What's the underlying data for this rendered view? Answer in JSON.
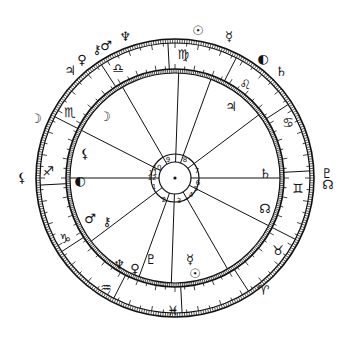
{
  "chart": {
    "center": [
      175,
      178
    ],
    "radii": {
      "outer_band_out": 139,
      "outer_band_in": 135,
      "inner_band_out": 109,
      "inner_band_in": 105,
      "hub_out": 24,
      "hub_in": 16
    },
    "ascendant_deg": 180,
    "colors": {
      "ink": "#111111",
      "paper": "#ffffff"
    }
  },
  "chart_data": {
    "type": "table",
    "zodiac_signs": [
      {
        "name": "Aries",
        "glyph": "♈",
        "pos": [
          263,
          290
        ]
      },
      {
        "name": "Taurus",
        "glyph": "♉",
        "pos": [
          278,
          250
        ]
      },
      {
        "name": "Gemini",
        "glyph": "♊",
        "pos": [
          298,
          188
        ]
      },
      {
        "name": "Cancer",
        "glyph": "♋",
        "pos": [
          288,
          122
        ]
      },
      {
        "name": "Leo",
        "glyph": "♌",
        "pos": [
          245,
          84
        ]
      },
      {
        "name": "Virgo",
        "glyph": "♍",
        "pos": [
          183,
          54
        ]
      },
      {
        "name": "Libra",
        "glyph": "♎",
        "pos": [
          118,
          68
        ]
      },
      {
        "name": "Scorpio",
        "glyph": "♏",
        "pos": [
          70,
          112
        ]
      },
      {
        "name": "Sagittarius",
        "glyph": "♐",
        "pos": [
          48,
          171
        ]
      },
      {
        "name": "Capricorn",
        "glyph": "♑",
        "pos": [
          65,
          238
        ]
      },
      {
        "name": "Aquarius",
        "glyph": "♒",
        "pos": [
          106,
          287
        ]
      },
      {
        "name": "Pisces",
        "glyph": "♓",
        "pos": [
          173,
          310
        ]
      }
    ],
    "house_cusp_angles": [
      180,
      217,
      250,
      268,
      300,
      333,
      0,
      37,
      70,
      88,
      120,
      153
    ],
    "house_numbers": [
      {
        "n": "1",
        "pos": [
          154,
          187
        ]
      },
      {
        "n": "2",
        "pos": [
          164,
          200
        ]
      },
      {
        "n": "3",
        "pos": [
          179,
          201
        ]
      },
      {
        "n": "4",
        "pos": [
          191,
          195
        ]
      },
      {
        "n": "5",
        "pos": [
          196,
          189
        ]
      },
      {
        "n": "6",
        "pos": [
          198,
          183
        ]
      },
      {
        "n": "7",
        "pos": [
          197,
          171
        ]
      },
      {
        "n": "8",
        "pos": [
          185,
          160
        ]
      },
      {
        "n": "9",
        "pos": [
          168,
          160
        ]
      },
      {
        "n": "10",
        "pos": [
          157,
          168
        ]
      },
      {
        "n": "11",
        "pos": [
          153,
          173
        ]
      },
      {
        "n": "12",
        "pos": [
          152,
          178
        ]
      }
    ],
    "inner_planets": [
      {
        "name": "Moon",
        "glyph": "☽",
        "pos": [
          105,
          116
        ]
      },
      {
        "name": "Jupiter",
        "glyph": "♃",
        "pos": [
          231,
          106
        ]
      },
      {
        "name": "Lilith",
        "glyph": "⚸",
        "pos": [
          85,
          153
        ]
      },
      {
        "name": "Sun (ASC)",
        "glyph": "◐",
        "pos": [
          80,
          180
        ]
      },
      {
        "name": "Mars",
        "glyph": "♂",
        "pos": [
          90,
          218
        ]
      },
      {
        "name": "Chiron",
        "glyph": "⚷",
        "pos": [
          107,
          221
        ]
      },
      {
        "name": "Neptune",
        "glyph": "♆",
        "pos": [
          119,
          264
        ]
      },
      {
        "name": "Venus",
        "glyph": "♀",
        "pos": [
          135,
          268
        ]
      },
      {
        "name": "Pluto",
        "glyph": "♇",
        "pos": [
          151,
          259
        ]
      },
      {
        "name": "Mercury",
        "glyph": "☿",
        "pos": [
          190,
          259
        ]
      },
      {
        "name": "Sun",
        "glyph": "☉",
        "pos": [
          195,
          273
        ]
      },
      {
        "name": "Saturn",
        "glyph": "♄",
        "pos": [
          265,
          173
        ]
      },
      {
        "name": "North Node",
        "glyph": "☊",
        "pos": [
          265,
          208
        ]
      }
    ],
    "outer_planets": [
      {
        "name": "Neptune",
        "glyph": "♆",
        "pos": [
          125,
          36
        ]
      },
      {
        "name": "Mars",
        "glyph": "♂",
        "pos": [
          106,
          45
        ]
      },
      {
        "name": "Chiron",
        "glyph": "⚷",
        "pos": [
          97,
          49
        ]
      },
      {
        "name": "Venus",
        "glyph": "♀",
        "pos": [
          82,
          59
        ]
      },
      {
        "name": "Jupiter",
        "glyph": "♃",
        "pos": [
          70,
          70
        ]
      },
      {
        "name": "Moon",
        "glyph": "☽",
        "pos": [
          36,
          118
        ]
      },
      {
        "name": "Lilith",
        "glyph": "⚸",
        "pos": [
          22,
          177
        ]
      },
      {
        "name": "Sun",
        "glyph": "☉",
        "pos": [
          198,
          30
        ]
      },
      {
        "name": "Mercury",
        "glyph": "☿",
        "pos": [
          229,
          36
        ]
      },
      {
        "name": "Moon",
        "glyph": "◐",
        "pos": [
          263,
          58
        ]
      },
      {
        "name": "Saturn",
        "glyph": "♄",
        "pos": [
          281,
          71
        ]
      },
      {
        "name": "Pluto",
        "glyph": "♇",
        "pos": [
          327,
          173
        ]
      },
      {
        "name": "North Node",
        "glyph": "☊",
        "pos": [
          328,
          184
        ]
      }
    ]
  }
}
